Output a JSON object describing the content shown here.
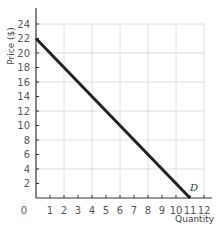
{
  "chart_data": {
    "type": "line",
    "title": "",
    "xlabel": "Quantity",
    "ylabel": "Price ($)",
    "xlim": [
      0,
      12
    ],
    "ylim": [
      0,
      24
    ],
    "x_ticks": [
      0,
      1,
      2,
      3,
      4,
      5,
      6,
      7,
      8,
      9,
      10,
      11,
      12
    ],
    "y_ticks": [
      2,
      4,
      6,
      8,
      10,
      12,
      14,
      16,
      18,
      20,
      22,
      24
    ],
    "grid": {
      "x_every": 2,
      "y_every": 4
    },
    "series": [
      {
        "name": "D",
        "label": "D",
        "x": [
          0,
          11
        ],
        "y": [
          22,
          0
        ],
        "color": "#222222"
      }
    ],
    "annotations": [
      {
        "text": "D",
        "x": 11.3,
        "y": 1.5
      }
    ]
  },
  "labels": {
    "origin": "0",
    "xlabel": "Quantity",
    "ylabel": "Price ($)",
    "curve": "D"
  }
}
